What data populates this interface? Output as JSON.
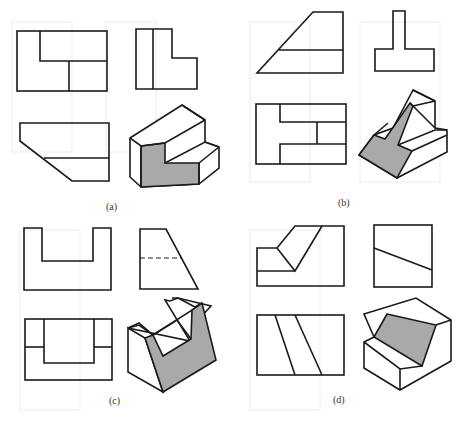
{
  "figure": {
    "panels": [
      {
        "id": "a",
        "label": "(a)"
      },
      {
        "id": "b",
        "label": "(b)"
      },
      {
        "id": "c",
        "label": "(c)"
      },
      {
        "id": "d",
        "label": "(d)"
      }
    ],
    "shade_color": "#a9a9a9",
    "line_color": "#1a1a1a"
  }
}
